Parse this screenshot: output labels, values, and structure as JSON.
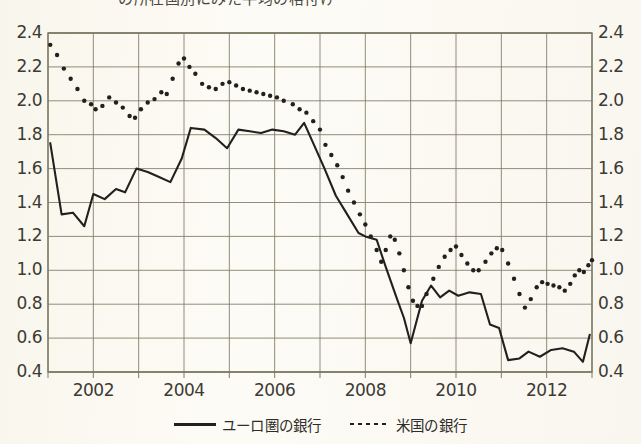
{
  "title": "の所在国別にみた平均の格付け",
  "legend": {
    "items": [
      {
        "label": "ユーロ圏の銀行",
        "style": "solid",
        "color": "#22201c"
      },
      {
        "label": "米国の銀行",
        "style": "dotted",
        "color": "#22201c"
      }
    ]
  },
  "axes": {
    "y_left_ticks": [
      "2.4",
      "2.2",
      "2.0",
      "1.8",
      "1.6",
      "1.4",
      "1.2",
      "1.0",
      "0.8",
      "0.6",
      "0.4"
    ],
    "y_right_ticks": [
      "2.4",
      "2.2",
      "2.0",
      "1.8",
      "1.6",
      "1.4",
      "1.2",
      "1.0",
      "0.8",
      "0.6",
      "0.4"
    ],
    "x_ticks": [
      "2002",
      "2004",
      "2006",
      "2008",
      "2010",
      "2012"
    ]
  },
  "chart_data": {
    "type": "line",
    "title": "の所在国別にみた平均の格付け",
    "xlabel": "",
    "ylabel": "",
    "ylim": [
      0.4,
      2.4
    ],
    "xlim": [
      2001.0,
      2013.0
    ],
    "ytick_step": 0.2,
    "grid": true,
    "legend_position": "bottom-center",
    "series": [
      {
        "name": "ユーロ圏の銀行",
        "style": "solid",
        "color": "#22201c",
        "points": [
          [
            2001.05,
            1.75
          ],
          [
            2001.3,
            1.33
          ],
          [
            2001.55,
            1.34
          ],
          [
            2001.8,
            1.26
          ],
          [
            2002.0,
            1.45
          ],
          [
            2002.25,
            1.42
          ],
          [
            2002.5,
            1.48
          ],
          [
            2002.7,
            1.46
          ],
          [
            2002.95,
            1.6
          ],
          [
            2003.2,
            1.58
          ],
          [
            2003.45,
            1.55
          ],
          [
            2003.7,
            1.52
          ],
          [
            2003.95,
            1.66
          ],
          [
            2004.15,
            1.84
          ],
          [
            2004.45,
            1.83
          ],
          [
            2004.7,
            1.78
          ],
          [
            2004.95,
            1.72
          ],
          [
            2005.2,
            1.83
          ],
          [
            2005.45,
            1.82
          ],
          [
            2005.7,
            1.81
          ],
          [
            2005.95,
            1.83
          ],
          [
            2006.2,
            1.82
          ],
          [
            2006.45,
            1.8
          ],
          [
            2006.65,
            1.87
          ],
          [
            2006.85,
            1.75
          ],
          [
            2007.1,
            1.6
          ],
          [
            2007.35,
            1.44
          ],
          [
            2007.6,
            1.33
          ],
          [
            2007.85,
            1.22
          ],
          [
            2008.0,
            1.2
          ],
          [
            2008.25,
            1.18
          ],
          [
            2008.45,
            1.02
          ],
          [
            2008.7,
            0.83
          ],
          [
            2008.85,
            0.72
          ],
          [
            2009.0,
            0.57
          ],
          [
            2009.25,
            0.82
          ],
          [
            2009.45,
            0.91
          ],
          [
            2009.65,
            0.84
          ],
          [
            2009.85,
            0.88
          ],
          [
            2010.05,
            0.85
          ],
          [
            2010.3,
            0.87
          ],
          [
            2010.55,
            0.86
          ],
          [
            2010.75,
            0.68
          ],
          [
            2010.95,
            0.66
          ],
          [
            2011.15,
            0.47
          ],
          [
            2011.4,
            0.48
          ],
          [
            2011.6,
            0.52
          ],
          [
            2011.85,
            0.49
          ],
          [
            2012.1,
            0.53
          ],
          [
            2012.35,
            0.54
          ],
          [
            2012.6,
            0.52
          ],
          [
            2012.8,
            0.46
          ],
          [
            2012.95,
            0.62
          ]
        ]
      },
      {
        "name": "米国の銀行",
        "style": "dotted",
        "color": "#22201c",
        "points": [
          [
            2001.05,
            2.33
          ],
          [
            2001.2,
            2.27
          ],
          [
            2001.35,
            2.19
          ],
          [
            2001.5,
            2.13
          ],
          [
            2001.65,
            2.07
          ],
          [
            2001.8,
            2.0
          ],
          [
            2001.95,
            1.98
          ],
          [
            2002.05,
            1.95
          ],
          [
            2002.2,
            1.97
          ],
          [
            2002.35,
            2.02
          ],
          [
            2002.5,
            1.99
          ],
          [
            2002.65,
            1.96
          ],
          [
            2002.8,
            1.91
          ],
          [
            2002.92,
            1.9
          ],
          [
            2003.05,
            1.95
          ],
          [
            2003.2,
            1.99
          ],
          [
            2003.35,
            2.01
          ],
          [
            2003.5,
            2.05
          ],
          [
            2003.62,
            2.04
          ],
          [
            2003.75,
            2.13
          ],
          [
            2003.88,
            2.22
          ],
          [
            2004.0,
            2.25
          ],
          [
            2004.12,
            2.2
          ],
          [
            2004.25,
            2.16
          ],
          [
            2004.4,
            2.1
          ],
          [
            2004.55,
            2.08
          ],
          [
            2004.7,
            2.07
          ],
          [
            2004.85,
            2.1
          ],
          [
            2005.0,
            2.11
          ],
          [
            2005.15,
            2.09
          ],
          [
            2005.3,
            2.07
          ],
          [
            2005.45,
            2.06
          ],
          [
            2005.6,
            2.05
          ],
          [
            2005.75,
            2.04
          ],
          [
            2005.9,
            2.03
          ],
          [
            2006.05,
            2.02
          ],
          [
            2006.2,
            2.0
          ],
          [
            2006.4,
            1.98
          ],
          [
            2006.55,
            1.95
          ],
          [
            2006.7,
            1.93
          ],
          [
            2006.85,
            1.88
          ],
          [
            2007.0,
            1.83
          ],
          [
            2007.12,
            1.74
          ],
          [
            2007.25,
            1.68
          ],
          [
            2007.38,
            1.62
          ],
          [
            2007.5,
            1.55
          ],
          [
            2007.62,
            1.47
          ],
          [
            2007.75,
            1.4
          ],
          [
            2007.88,
            1.33
          ],
          [
            2008.0,
            1.27
          ],
          [
            2008.12,
            1.2
          ],
          [
            2008.25,
            1.12
          ],
          [
            2008.35,
            1.05
          ],
          [
            2008.45,
            1.12
          ],
          [
            2008.55,
            1.2
          ],
          [
            2008.65,
            1.18
          ],
          [
            2008.75,
            1.1
          ],
          [
            2008.85,
            1.0
          ],
          [
            2008.95,
            0.9
          ],
          [
            2009.05,
            0.82
          ],
          [
            2009.15,
            0.79
          ],
          [
            2009.25,
            0.79
          ],
          [
            2009.35,
            0.86
          ],
          [
            2009.5,
            0.95
          ],
          [
            2009.62,
            1.02
          ],
          [
            2009.75,
            1.08
          ],
          [
            2009.88,
            1.12
          ],
          [
            2010.0,
            1.14
          ],
          [
            2010.12,
            1.09
          ],
          [
            2010.25,
            1.04
          ],
          [
            2010.38,
            1.0
          ],
          [
            2010.5,
            1.0
          ],
          [
            2010.65,
            1.05
          ],
          [
            2010.78,
            1.1
          ],
          [
            2010.9,
            1.13
          ],
          [
            2011.02,
            1.12
          ],
          [
            2011.15,
            1.04
          ],
          [
            2011.28,
            0.95
          ],
          [
            2011.4,
            0.86
          ],
          [
            2011.52,
            0.78
          ],
          [
            2011.65,
            0.83
          ],
          [
            2011.78,
            0.9
          ],
          [
            2011.9,
            0.93
          ],
          [
            2012.02,
            0.92
          ],
          [
            2012.15,
            0.91
          ],
          [
            2012.28,
            0.9
          ],
          [
            2012.4,
            0.88
          ],
          [
            2012.52,
            0.92
          ],
          [
            2012.62,
            0.97
          ],
          [
            2012.72,
            1.0
          ],
          [
            2012.82,
            0.99
          ],
          [
            2012.92,
            1.03
          ],
          [
            2013.0,
            1.06
          ]
        ]
      }
    ]
  }
}
